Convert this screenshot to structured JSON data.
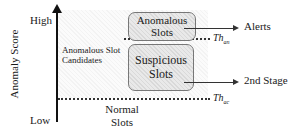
{
  "axis": {
    "label": "Anomaly Score",
    "high_label": "High",
    "low_label": "Low"
  },
  "regions": {
    "candidates_label_line1": "Anomalous Slot",
    "candidates_label_line2": "Candidates",
    "normal_line1": "Normal",
    "normal_line2": "Slots"
  },
  "boxes": {
    "anomalous": {
      "line1": "Anomalous",
      "line2": "Slots"
    },
    "suspicious": {
      "line1": "Suspicious",
      "line2": "Slots"
    }
  },
  "outputs": {
    "alerts": "Alerts",
    "second_stage": "2nd Stage"
  },
  "thresholds": {
    "upper": {
      "base": "Th",
      "sub": "an"
    },
    "lower": {
      "base": "Th",
      "sub": "ac"
    }
  }
}
